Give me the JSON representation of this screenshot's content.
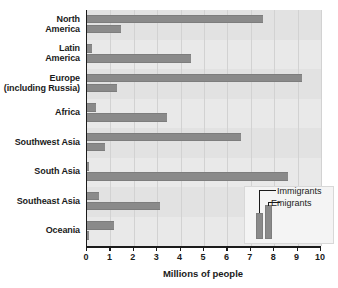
{
  "chart_data": {
    "type": "bar",
    "orientation": "horizontal",
    "title": "",
    "xlabel": "Millions of people",
    "ylabel": "",
    "xlim": [
      0,
      10
    ],
    "xticks": [
      "0",
      "1",
      "2",
      "3",
      "4",
      "5",
      "6",
      "7",
      "8",
      "9",
      "10"
    ],
    "grid": true,
    "legend_position": "bottom-right",
    "categories": [
      "North America",
      "Latin America",
      "Europe (including Russia)",
      "Africa",
      "Southwest Asia",
      "South Asia",
      "Southeast Asia",
      "Oceania"
    ],
    "category_lines": [
      [
        "North",
        "America"
      ],
      [
        "Latin",
        "America"
      ],
      [
        "Europe",
        "(including Russia)"
      ],
      [
        "Africa"
      ],
      [
        "Southwest Asia"
      ],
      [
        "South Asia"
      ],
      [
        "Southeast Asia"
      ],
      [
        "Oceania"
      ]
    ],
    "series": [
      {
        "name": "Immigrants",
        "color": "#8a8a8a",
        "values": [
          7.5,
          0.2,
          9.2,
          0.4,
          6.6,
          0.1,
          0.5,
          1.15
        ]
      },
      {
        "name": "Emigrants",
        "color": "#8a8a8a",
        "values": [
          1.45,
          4.45,
          1.3,
          3.4,
          0.75,
          8.6,
          3.1,
          0.1
        ]
      }
    ]
  },
  "legend": {
    "immigrants_label": "Immigrants",
    "emigrants_label": "Emigrants"
  },
  "colors": {
    "bar": "#8a8a8a",
    "plot_background": "#e9e9e9",
    "gridline": "#d2d2d2",
    "axis": "#1b1b1b",
    "page_background": "#ffffff"
  }
}
